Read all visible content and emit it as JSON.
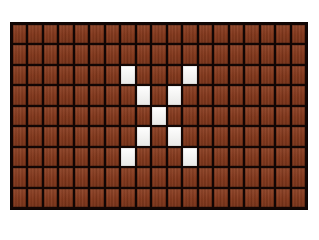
{
  "page": {
    "background_color": "#ffffff"
  },
  "grid": {
    "label": "brick-wall-grid",
    "columns": 19,
    "rows": 9,
    "mortar_color": "#120604",
    "brick_color": "#8a3a1c",
    "marker_color": "#f7f7f5",
    "cell_width_px": 15.4,
    "cell_height_px": 20.5,
    "origin_x_px": 10,
    "origin_y_px": 22,
    "width_px": 298,
    "height_px": 188
  },
  "chart_data": {
    "type": "heatmap",
    "xlabel": "",
    "ylabel": "",
    "columns": 19,
    "rows": 9,
    "legend": [
      {
        "label": "brick",
        "value": 0,
        "color": "#8a3a1c"
      },
      {
        "label": "marker",
        "value": 1,
        "color": "#f7f7f5"
      }
    ],
    "matrix": [
      [
        0,
        0,
        0,
        0,
        0,
        0,
        0,
        0,
        0,
        0,
        0,
        0,
        0,
        0,
        0,
        0,
        0,
        0,
        0
      ],
      [
        0,
        0,
        0,
        0,
        0,
        0,
        0,
        0,
        0,
        0,
        0,
        0,
        0,
        0,
        0,
        0,
        0,
        0,
        0
      ],
      [
        0,
        0,
        0,
        0,
        0,
        0,
        0,
        1,
        0,
        0,
        0,
        1,
        0,
        0,
        0,
        0,
        0,
        0,
        0
      ],
      [
        0,
        0,
        0,
        0,
        0,
        0,
        0,
        0,
        1,
        0,
        1,
        0,
        0,
        0,
        0,
        0,
        0,
        0,
        0
      ],
      [
        0,
        0,
        0,
        0,
        0,
        0,
        0,
        0,
        0,
        1,
        0,
        0,
        0,
        0,
        0,
        0,
        0,
        0,
        0
      ],
      [
        0,
        0,
        0,
        0,
        0,
        0,
        0,
        0,
        1,
        0,
        1,
        0,
        0,
        0,
        0,
        0,
        0,
        0,
        0
      ],
      [
        0,
        0,
        0,
        0,
        0,
        0,
        0,
        1,
        0,
        0,
        0,
        1,
        0,
        0,
        0,
        0,
        0,
        0,
        0
      ],
      [
        0,
        0,
        0,
        0,
        0,
        0,
        0,
        0,
        0,
        0,
        0,
        0,
        0,
        0,
        0,
        0,
        0,
        0,
        0
      ],
      [
        0,
        0,
        0,
        0,
        0,
        0,
        0,
        0,
        0,
        0,
        0,
        0,
        0,
        0,
        0,
        0,
        0,
        0,
        0
      ]
    ],
    "marker_cells": [
      {
        "row": 2,
        "col": 7
      },
      {
        "row": 2,
        "col": 11
      },
      {
        "row": 3,
        "col": 8
      },
      {
        "row": 3,
        "col": 10
      },
      {
        "row": 4,
        "col": 9
      },
      {
        "row": 5,
        "col": 8
      },
      {
        "row": 5,
        "col": 10
      },
      {
        "row": 6,
        "col": 7
      },
      {
        "row": 6,
        "col": 11
      }
    ],
    "marker_count": 9,
    "total_cells": 171,
    "pattern_name": "X"
  }
}
